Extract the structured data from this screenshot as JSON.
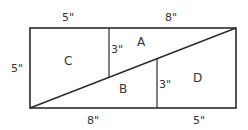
{
  "diagram": {
    "colors": {
      "stroke": "#2b2b2b",
      "text": "#333333",
      "background": "#ffffff"
    },
    "dimensions": {
      "top_left": "5\"",
      "top_right": "8\"",
      "left_side": "5\"",
      "bottom_left": "8\"",
      "bottom_right": "5\"",
      "inner_left_segment": "3\"",
      "inner_right_segment": "3\""
    },
    "regions": {
      "a": "A",
      "b": "B",
      "c": "C",
      "d": "D"
    }
  }
}
